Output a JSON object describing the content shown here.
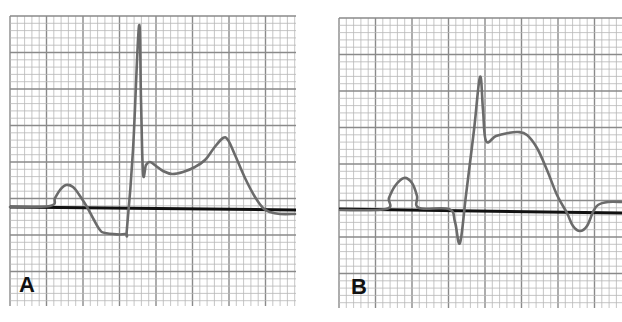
{
  "figure": {
    "panels": [
      {
        "id": "A",
        "label": "A",
        "description": "ECG complex with marked ST-segment elevation (tall R wave, elevated ST with peaked T wave)",
        "box": {
          "x": 10,
          "y": 16,
          "w": 286,
          "h": 290
        },
        "baseline": [
          [
            10,
            207
          ],
          [
            296,
            210
          ]
        ],
        "trace": [
          [
            10,
            207
          ],
          [
            50,
            206
          ],
          [
            55,
            198
          ],
          [
            60,
            190
          ],
          [
            66,
            185
          ],
          [
            73,
            187
          ],
          [
            80,
            196
          ],
          [
            87,
            207
          ],
          [
            94,
            220
          ],
          [
            100,
            230
          ],
          [
            105,
            233
          ],
          [
            125,
            234
          ],
          [
            127,
            228
          ],
          [
            133,
            150
          ],
          [
            139,
            26
          ],
          [
            141,
            100
          ],
          [
            143,
            173
          ],
          [
            146,
            165
          ],
          [
            150,
            162
          ],
          [
            156,
            166
          ],
          [
            163,
            171
          ],
          [
            172,
            174
          ],
          [
            183,
            172
          ],
          [
            195,
            167
          ],
          [
            205,
            160
          ],
          [
            214,
            148
          ],
          [
            223,
            138
          ],
          [
            228,
            140
          ],
          [
            235,
            155
          ],
          [
            245,
            178
          ],
          [
            255,
            197
          ],
          [
            263,
            208
          ],
          [
            270,
            212
          ],
          [
            280,
            214
          ],
          [
            295,
            214
          ]
        ],
        "label_pos": {
          "x": 19,
          "y": 274
        }
      },
      {
        "id": "B",
        "label": "B",
        "description": "ECG complex with ST elevation (dome-shaped ST segment) followed by T-wave inversion",
        "box": {
          "x": 339,
          "y": 18,
          "w": 283,
          "h": 290
        },
        "baseline": [
          [
            339,
            209
          ],
          [
            622,
            213
          ]
        ],
        "trace": [
          [
            340,
            210
          ],
          [
            386,
            209
          ],
          [
            389,
            198
          ],
          [
            395,
            186
          ],
          [
            404,
            178
          ],
          [
            412,
            183
          ],
          [
            417,
            196
          ],
          [
            419,
            208
          ],
          [
            449,
            209
          ],
          [
            455,
            222
          ],
          [
            460,
            243
          ],
          [
            466,
            195
          ],
          [
            474,
            130
          ],
          [
            480,
            77
          ],
          [
            483,
            110
          ],
          [
            486,
            141
          ],
          [
            496,
            136
          ],
          [
            508,
            133
          ],
          [
            518,
            132
          ],
          [
            527,
            135
          ],
          [
            537,
            148
          ],
          [
            547,
            170
          ],
          [
            557,
            195
          ],
          [
            567,
            213
          ],
          [
            573,
            226
          ],
          [
            580,
            231
          ],
          [
            587,
            226
          ],
          [
            593,
            212
          ],
          [
            598,
            205
          ],
          [
            608,
            202
          ],
          [
            622,
            202
          ]
        ],
        "label_pos": {
          "x": 351,
          "y": 276
        }
      }
    ],
    "grid": {
      "minor_spacing": 7.3,
      "major_every": 5,
      "minor_color": "#b8b8b8",
      "major_color": "#8a8a8a"
    },
    "colors": {
      "trace": "#6b6b6b",
      "baseline": "#111111",
      "background": "#ffffff"
    }
  }
}
